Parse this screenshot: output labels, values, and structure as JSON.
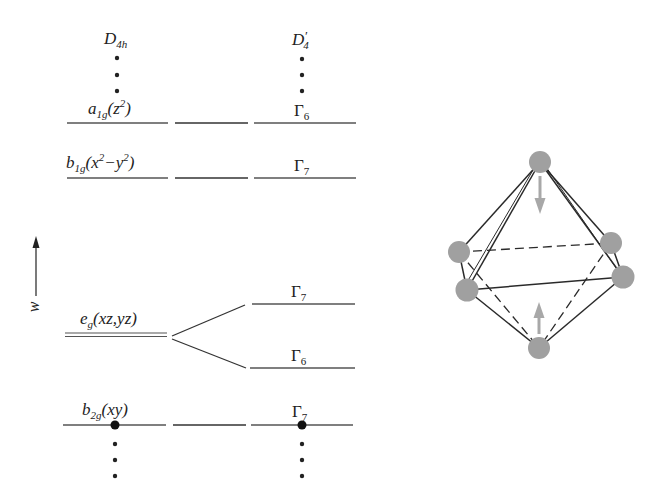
{
  "diagram": {
    "type": "energy-level-correlation",
    "columns": {
      "left": {
        "group": "D",
        "group_sub": "4h"
      },
      "right": {
        "group": "D",
        "group_prime": "′",
        "group_sub": "4"
      }
    },
    "axis": {
      "label": "w",
      "direction": "up"
    },
    "levels": [
      {
        "left_main": "a",
        "left_sub": "1g",
        "left_orbital_pre": "(z",
        "left_sup": "2",
        "left_orbital_post": ")",
        "right_main": "Γ",
        "right_sub": "6"
      },
      {
        "left_main": "b",
        "left_sub": "1g",
        "left_orbital_pre": "(x",
        "left_sup": "2",
        "left_orbital_mid": "−y",
        "left_sup2": "2",
        "left_orbital_post": ")",
        "right_main": "Γ",
        "right_sub": "7"
      },
      {
        "left_main": "e",
        "left_sub": "g",
        "left_orbital_pre": "(xz,yz)",
        "right_upper_main": "Γ",
        "right_upper_sub": "7",
        "right_lower_main": "Γ",
        "right_lower_sub": "6"
      },
      {
        "left_main": "b",
        "left_sub": "2g",
        "left_orbital_pre": "(xy)",
        "right_main": "Γ",
        "right_sub": "7"
      }
    ],
    "octahedron": {
      "description": "octahedral complex with tetragonal compression arrows on axial ligands",
      "vertices": 6,
      "sphere_color": "#a0a0a0",
      "arrow_color": "#a8a8a8",
      "edge_color": "#2a2a2a"
    }
  }
}
